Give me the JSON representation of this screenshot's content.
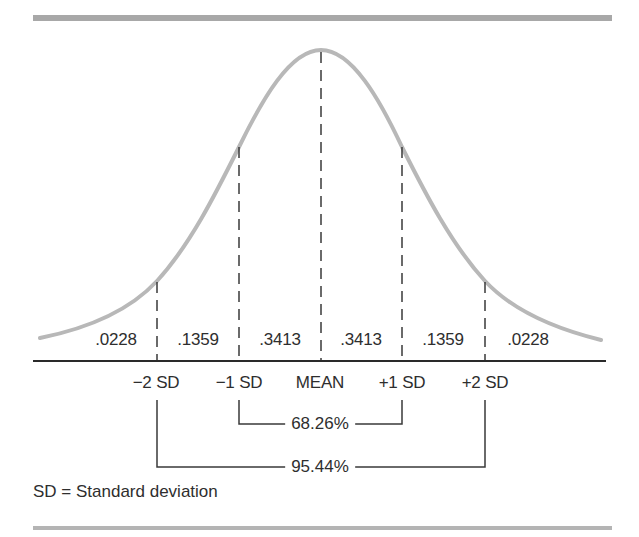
{
  "figure": {
    "type": "normal-distribution",
    "curve_color": "#b8b8b8",
    "line_color": "#333333",
    "rule_color": "#a8a8a8"
  },
  "regions": [
    {
      "label": ".0228",
      "from": "-inf",
      "to": "-2 SD"
    },
    {
      "label": ".1359",
      "from": "-2 SD",
      "to": "-1 SD"
    },
    {
      "label": ".3413",
      "from": "-1 SD",
      "to": "MEAN"
    },
    {
      "label": ".3413",
      "from": "MEAN",
      "to": "+1 SD"
    },
    {
      "label": ".1359",
      "from": "+1 SD",
      "to": "+2 SD"
    },
    {
      "label": ".0228",
      "from": "+2 SD",
      "to": "+inf"
    }
  ],
  "axis_labels": [
    {
      "label": "−2 SD"
    },
    {
      "label": "−1 SD"
    },
    {
      "label": "MEAN"
    },
    {
      "label": "+1 SD"
    },
    {
      "label": "+2 SD"
    }
  ],
  "brackets": [
    {
      "label": "68.26%",
      "from": "−1 SD",
      "to": "+1 SD"
    },
    {
      "label": "95.44%",
      "from": "−2 SD",
      "to": "+2 SD"
    }
  ],
  "legend": "SD = Standard deviation"
}
